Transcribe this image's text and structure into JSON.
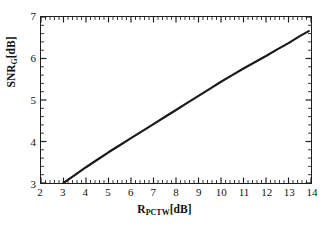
{
  "chart_data": {
    "type": "line",
    "title": "",
    "xlabel": "R_PCTW[dB]",
    "ylabel": "SNR_G[dB]",
    "xlabel_parts": {
      "base": "R",
      "sub": "PCTW",
      "unit": "[dB]"
    },
    "ylabel_parts": {
      "base": "SNR",
      "sub": "G",
      "unit": "[dB]"
    },
    "xlim": [
      2,
      14
    ],
    "ylim": [
      3,
      7
    ],
    "xticks": [
      2,
      3,
      4,
      5,
      6,
      7,
      8,
      9,
      10,
      11,
      12,
      13,
      14
    ],
    "yticks": [
      3,
      4,
      5,
      6,
      7
    ],
    "xtick_labels": [
      "2",
      "3",
      "4",
      "5",
      "6",
      "7",
      "8",
      "9",
      "10",
      "11",
      "12",
      "13",
      "14"
    ],
    "ytick_labels": [
      "3",
      "4",
      "5",
      "6",
      "7"
    ],
    "minor_ticks_per_interval": 4,
    "grid": false,
    "legend": null,
    "line_color": "#1a1a1a",
    "line_width": 2.2,
    "series": [
      {
        "name": "SNR_G vs R_PCTW",
        "x": [
          3.0,
          3.5,
          4.0,
          4.5,
          5.0,
          5.5,
          6.0,
          6.5,
          7.0,
          7.5,
          8.0,
          8.5,
          9.0,
          9.5,
          10.0,
          10.5,
          11.0,
          11.5,
          12.0,
          12.5,
          13.0,
          13.5,
          13.9
        ],
        "y": [
          3.0,
          3.19,
          3.38,
          3.56,
          3.74,
          3.91,
          4.08,
          4.25,
          4.42,
          4.59,
          4.76,
          4.93,
          5.1,
          5.27,
          5.44,
          5.6,
          5.76,
          5.91,
          6.06,
          6.22,
          6.37,
          6.54,
          6.66
        ]
      }
    ]
  },
  "axes": {
    "xlabel_display": "R",
    "xlabel_sub": "PCTW",
    "xlabel_unit": "[dB]",
    "ylabel_display": "SNR",
    "ylabel_sub": "G",
    "ylabel_unit": "[dB]"
  }
}
